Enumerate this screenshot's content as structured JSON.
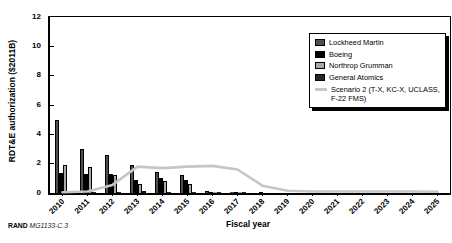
{
  "figure": {
    "caption_prefix": "RAND",
    "caption_id": "MG1133-C.3"
  },
  "chart_data": {
    "type": "bar",
    "title": "",
    "xlabel": "Fiscal year",
    "ylabel": "RDT&E authorization ($2011B)",
    "ylim": [
      0,
      12
    ],
    "ytick_step": 2,
    "grid": false,
    "legend_position": "upper right",
    "categories": [
      "2010",
      "2011",
      "2012",
      "2013",
      "2014",
      "2015",
      "2016",
      "2017",
      "2018",
      "2019",
      "2020",
      "2021",
      "2022",
      "2023",
      "2024",
      "2025"
    ],
    "series": [
      {
        "name": "Lockheed Martin",
        "type": "bar",
        "color": "#4f4f4f",
        "values": [
          5.0,
          3.0,
          2.6,
          1.9,
          1.4,
          1.2,
          0.15,
          0.1,
          0,
          0,
          0,
          0,
          0,
          0,
          0,
          0
        ]
      },
      {
        "name": "Boeing",
        "type": "bar",
        "color": "#000000",
        "values": [
          1.35,
          1.3,
          1.3,
          0.9,
          1.0,
          0.9,
          0.1,
          0.1,
          0.05,
          0,
          0,
          0,
          0,
          0,
          0,
          0
        ]
      },
      {
        "name": "Northrop Grumman",
        "type": "bar",
        "color": "#a8a8a8",
        "values": [
          1.9,
          1.8,
          1.2,
          0.6,
          0.8,
          0.6,
          0.1,
          0.05,
          0,
          0,
          0,
          0,
          0,
          0,
          0,
          0
        ]
      },
      {
        "name": "General Atomics",
        "type": "bar",
        "color": "#262626",
        "values": [
          0.1,
          0.1,
          0.1,
          0.15,
          0.1,
          0.1,
          0.05,
          0.05,
          0,
          0,
          0,
          0,
          0,
          0,
          0,
          0
        ]
      },
      {
        "name": "Scenario 2 (T-X, KC-X, UCLASS, F-22 FMS)",
        "type": "line",
        "color": "#c6c6c6",
        "values": [
          0.05,
          0.1,
          0.55,
          1.8,
          1.7,
          1.8,
          1.85,
          1.6,
          0.5,
          0.15,
          0.1,
          0.1,
          0.1,
          0.1,
          0.1,
          0.08
        ]
      }
    ]
  }
}
